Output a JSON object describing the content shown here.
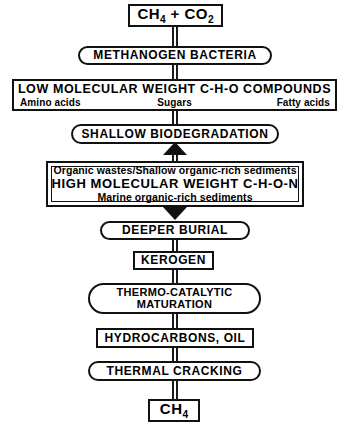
{
  "diagram": {
    "stroke_color": "#111111",
    "background_color": "#ffffff",
    "nodes": [
      {
        "id": "ch4-co2",
        "shape": "rectangle",
        "text": "CH4 + CO2",
        "text_parts": {
          "pre": "CH",
          "sub1": "4",
          "mid": " + CO",
          "sub2": "2"
        }
      },
      {
        "id": "methanogen-bacteria",
        "shape": "pill",
        "text": "METHANOGEN BACTERIA"
      },
      {
        "id": "low-molecular-weight",
        "shape": "rectangle",
        "text": "LOW MOLECULAR WEIGHT C-H-O COMPOUNDS",
        "sublabels": [
          "Amino acids",
          "Sugars",
          "Fatty acids"
        ]
      },
      {
        "id": "shallow-biodegradation",
        "shape": "pill",
        "text": "SHALLOW BIODEGRADATION"
      },
      {
        "id": "high-molecular-weight",
        "shape": "double-rectangle",
        "line1": "Organic wastes/Shallow organic-rich sediments",
        "line2": "HIGH MOLECULAR WEIGHT C-H-O-N",
        "line3": "Marine organic-rich sediments"
      },
      {
        "id": "deeper-burial",
        "shape": "pill",
        "text": "DEEPER BURIAL"
      },
      {
        "id": "kerogen",
        "shape": "rectangle",
        "text": "KEROGEN"
      },
      {
        "id": "thermo-catalytic-maturation",
        "shape": "pill",
        "line1": "THERMO-CATALYTIC",
        "line2": "MATURATION"
      },
      {
        "id": "hydrocarbons-oil",
        "shape": "rectangle",
        "text": "HYDROCARBONS, OIL"
      },
      {
        "id": "thermal-cracking",
        "shape": "pill",
        "text": "THERMAL CRACKING"
      },
      {
        "id": "ch4-final",
        "shape": "rectangle",
        "text": "CH4",
        "text_parts": {
          "pre": "CH",
          "sub1": "4"
        }
      }
    ],
    "arrows": [
      {
        "id": "arrow-to-shallow-biodegradation",
        "direction": "up"
      },
      {
        "id": "arrow-to-deeper-burial",
        "direction": "down"
      }
    ]
  }
}
